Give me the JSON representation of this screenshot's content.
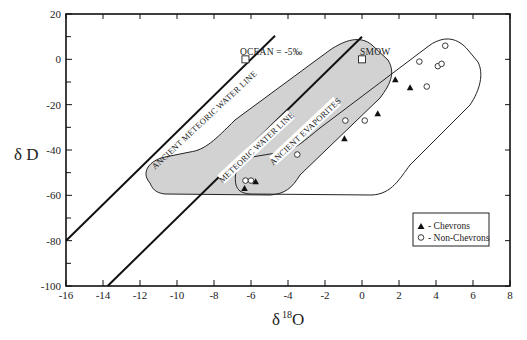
{
  "chart_data": {
    "type": "scatter",
    "title": "",
    "xlabel": "δ",
    "xlabel_sup": "18",
    "xlabel_suffix": "O",
    "ylabel": "δ D",
    "xlim": [
      -16,
      8
    ],
    "ylim": [
      -100,
      20
    ],
    "x_ticks": [
      -16,
      -14,
      -12,
      -10,
      -8,
      -6,
      -4,
      -2,
      0,
      2,
      4,
      6,
      8
    ],
    "y_ticks": [
      -100,
      -80,
      -60,
      -40,
      -20,
      0,
      20
    ],
    "y_minor_ticks": [
      -90,
      -70,
      -50,
      -30,
      -10,
      10
    ],
    "grid": false,
    "lines": [
      {
        "name": "ANCIENT METEORIC WATER LINE",
        "equation": "δD = 8·δ18O + 48",
        "x_range": [
          -16,
          -4.7
        ]
      },
      {
        "name": "METEORIC WATER LINE",
        "equation": "δD = 8·δ18O + 10",
        "x_range": [
          -13.75,
          0
        ]
      }
    ],
    "regions": [
      {
        "name": "ANCIENT EVAPORITES (shaded field)",
        "fill": "#d4d4d4"
      },
      {
        "name": "Chevron field (unshaded)",
        "fill": "none"
      }
    ],
    "reference_points": [
      {
        "label": "OCEAN = -5‰",
        "x": -6.3,
        "y": 0
      },
      {
        "label": "SMOW",
        "x": 0,
        "y": 0
      }
    ],
    "series": [
      {
        "name": "Chevrons",
        "marker": "filled-triangle",
        "points": [
          {
            "x": 1.8,
            "y": -9
          },
          {
            "x": 2.6,
            "y": -12.5
          },
          {
            "x": 0.85,
            "y": -24
          },
          {
            "x": -0.95,
            "y": -35
          },
          {
            "x": -5.75,
            "y": -54
          },
          {
            "x": -6.35,
            "y": -57
          }
        ]
      },
      {
        "name": "Non-Chevrons",
        "marker": "open-circle",
        "points": [
          {
            "x": 4.5,
            "y": 6
          },
          {
            "x": 3.1,
            "y": -1
          },
          {
            "x": 4.1,
            "y": -3
          },
          {
            "x": 4.3,
            "y": -2
          },
          {
            "x": 3.5,
            "y": -12
          },
          {
            "x": -0.9,
            "y": -27
          },
          {
            "x": 0.15,
            "y": -27
          },
          {
            "x": -3.5,
            "y": -42
          },
          {
            "x": -6.3,
            "y": -53.5
          },
          {
            "x": -6.0,
            "y": -53.5
          }
        ]
      }
    ],
    "legend": {
      "position": "bottom-right",
      "entries": [
        {
          "symbol": "▲",
          "label": "- Chevrons"
        },
        {
          "symbol": "○",
          "label": "- Non-Chevrons"
        }
      ]
    },
    "annotations": {
      "ancient_mwl": "ANCIENT METEORIC WATER LINE",
      "mwl": "METEORIC WATER LINE",
      "evaporites": "ANCIENT EVAPORITES",
      "ocean": "OCEAN = -5‰",
      "smow": "SMOW"
    }
  }
}
